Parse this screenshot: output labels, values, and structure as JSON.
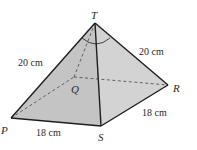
{
  "diagram": {
    "type": "square-based pyramid",
    "vertices": {
      "T": {
        "label": "T",
        "x": 95,
        "y": 23
      },
      "P": {
        "label": "P",
        "x": 11,
        "y": 118
      },
      "Q": {
        "label": "Q",
        "x": 74,
        "y": 77
      },
      "R": {
        "label": "R",
        "x": 168,
        "y": 85
      },
      "S": {
        "label": "S",
        "x": 101,
        "y": 126
      }
    },
    "edge_labels": {
      "TP": "20 cm",
      "TR": "20 cm",
      "PS": "18 cm",
      "SR": "18 cm"
    },
    "angle_marker": "angle PTR",
    "colors": {
      "face_fill": "#c6c6c6",
      "face_fill_right": "#d2d2d2",
      "edge": "#1e1e1e",
      "hidden_edge": "#555555"
    }
  }
}
